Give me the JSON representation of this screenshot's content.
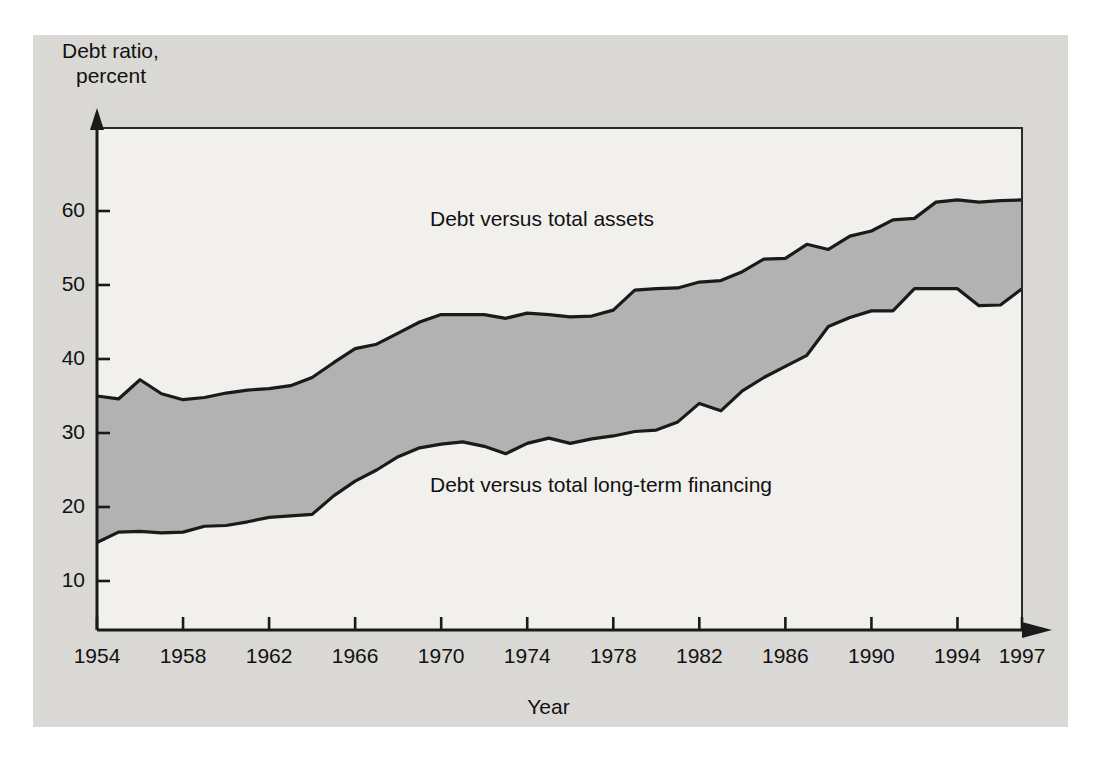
{
  "figure": {
    "background_color": "#dcdbd8",
    "plot_background_color": "#f1f0ed",
    "band_fill_color": "#b2b2b2",
    "line_color": "#1a1a1a"
  },
  "axes": {
    "y_title_line1": "Debt ratio,",
    "y_title_line2": "percent",
    "x_title": "Year",
    "y_ticks": [
      "10",
      "20",
      "30",
      "40",
      "50",
      "60"
    ],
    "x_ticks": [
      "1954",
      "1958",
      "1962",
      "1966",
      "1970",
      "1974",
      "1978",
      "1982",
      "1986",
      "1990",
      "1994",
      "1997"
    ]
  },
  "labels": {
    "upper_series": "Debt versus total assets",
    "lower_series": "Debt versus total long-term financing"
  },
  "chart_data": {
    "type": "area",
    "title": "",
    "subtitle": "",
    "xlabel": "Year",
    "ylabel": "Debt ratio, percent",
    "xlim": [
      1954,
      1997
    ],
    "ylim": [
      0,
      68
    ],
    "grid": false,
    "legend_position": "inline-annotation",
    "x": [
      1954,
      1955,
      1956,
      1957,
      1958,
      1959,
      1960,
      1961,
      1962,
      1963,
      1964,
      1965,
      1966,
      1967,
      1968,
      1969,
      1970,
      1971,
      1972,
      1973,
      1974,
      1975,
      1976,
      1977,
      1978,
      1979,
      1980,
      1981,
      1982,
      1983,
      1984,
      1985,
      1986,
      1987,
      1988,
      1989,
      1990,
      1991,
      1992,
      1993,
      1994,
      1995,
      1996,
      1997
    ],
    "series": [
      {
        "name": "Debt versus total assets",
        "values": [
          35.0,
          34.6,
          37.2,
          35.3,
          34.5,
          34.8,
          35.4,
          35.8,
          36.0,
          36.4,
          37.5,
          39.5,
          41.4,
          42.0,
          43.5,
          45.0,
          46.0,
          46.0,
          46.0,
          45.5,
          46.2,
          46.0,
          45.7,
          45.8,
          46.6,
          49.3,
          49.5,
          49.6,
          50.4,
          50.6,
          51.8,
          53.5,
          53.6,
          55.5,
          54.8,
          56.6,
          57.3,
          58.8,
          59.0,
          61.2,
          61.5,
          61.2,
          61.4,
          61.5
        ]
      },
      {
        "name": "Debt versus total long-term financing",
        "values": [
          15.2,
          16.6,
          16.7,
          16.5,
          16.6,
          17.4,
          17.5,
          18.0,
          18.6,
          18.8,
          19.0,
          21.5,
          23.5,
          25.0,
          26.8,
          28.0,
          28.5,
          28.8,
          28.2,
          27.2,
          28.6,
          29.3,
          28.6,
          29.2,
          29.6,
          30.2,
          30.4,
          31.5,
          34.0,
          33.0,
          35.7,
          37.5,
          39.0,
          40.5,
          44.4,
          45.6,
          46.5,
          46.5,
          49.5,
          49.5,
          49.5,
          47.2,
          47.3,
          49.5
        ]
      }
    ]
  }
}
